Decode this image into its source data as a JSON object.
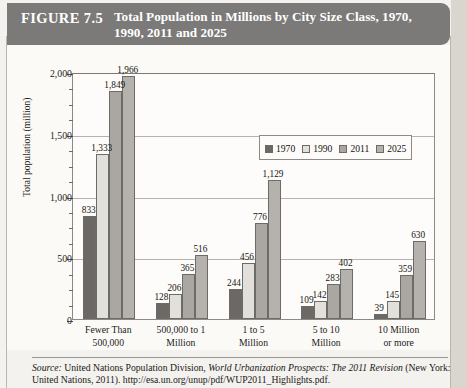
{
  "figure": {
    "number": "FIGURE 7.5",
    "title": "Total Population in Millions by City Size Class, 1970, 1990, 2011 and 2025"
  },
  "source": {
    "label": "Source:",
    "text_before": " United Nations Population Division, ",
    "italic_title": "World Urbanization Prospects: The 2011 Revision",
    "text_after": " (New York: United Nations, 2011). http://esa.un.org/unup/pdf/WUP2011_Highlights.pdf."
  },
  "chart_data": {
    "type": "bar",
    "title": "Total Population in Millions by City Size Class, 1970, 1990, 2011 and 2025",
    "xlabel": "",
    "ylabel": "Total population (million)",
    "ylim": [
      0,
      2000
    ],
    "ytick_labels": [
      "0",
      "500",
      "1,000",
      "1,500",
      "2,000"
    ],
    "ytick_values": [
      0,
      500,
      1000,
      1500,
      2000
    ],
    "yminor_interval": 125,
    "grid": true,
    "legend_position": "upper right",
    "categories": [
      "Fewer Than 500,000",
      "500,000 to 1 Million",
      "1 to 5 Million",
      "5 to 10 Million",
      "10 Million or more"
    ],
    "category_lines": [
      [
        "Fewer Than",
        "500,000"
      ],
      [
        "500,000 to 1",
        "Million"
      ],
      [
        "1 to 5",
        "Million"
      ],
      [
        "5 to 10",
        "Million"
      ],
      [
        "10 Million",
        "or more"
      ]
    ],
    "series": [
      {
        "name": "1970",
        "color": "#6b6866",
        "values": [
          833,
          128,
          244,
          109,
          39
        ],
        "labels": [
          "833",
          "128",
          "244",
          "109",
          "39"
        ]
      },
      {
        "name": "1990",
        "color": "#e2e0da",
        "values": [
          1333,
          206,
          456,
          142,
          145
        ],
        "labels": [
          "1,333",
          "206",
          "456",
          "142",
          "145"
        ]
      },
      {
        "name": "2011",
        "color": "#aaa7a2",
        "values": [
          1849,
          365,
          776,
          283,
          359
        ],
        "labels": [
          "1,849",
          "365",
          "776",
          "283",
          "359"
        ]
      },
      {
        "name": "2025",
        "color": "#b5b2ad",
        "values": [
          1966,
          516,
          1129,
          402,
          630
        ],
        "labels": [
          "1,966",
          "516",
          "1,129",
          "402",
          "630"
        ]
      }
    ]
  }
}
